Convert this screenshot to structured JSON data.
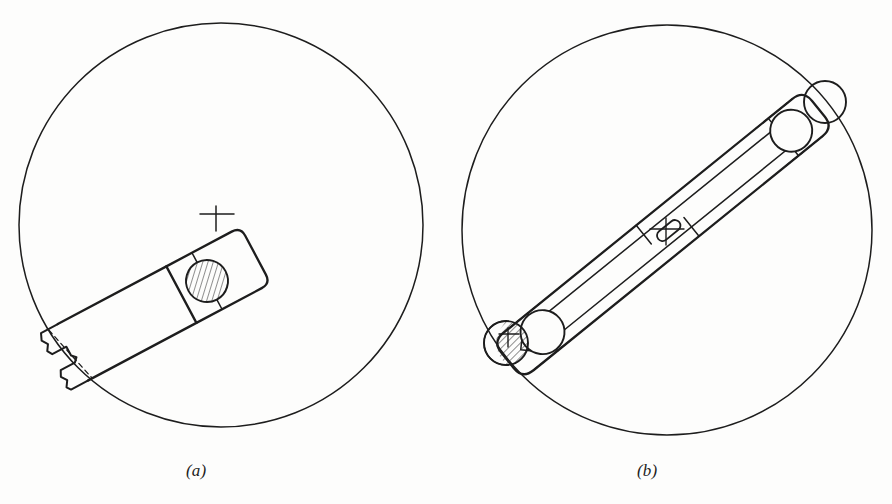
{
  "plate": {
    "title": "Two-view mechanism layout plate",
    "background_color": "#fdfdfc",
    "line_color": "#1d1d1d",
    "hatch_color": "#2a2a2a",
    "width": 892,
    "height": 504
  },
  "figures": [
    {
      "id": "a",
      "caption": "(a)",
      "description": "Single crank arm with one hatched pin boss inside a large circle, bar broken off at far end",
      "circle": {
        "cx": 221,
        "cy": 225,
        "r": 202
      },
      "bar_angle_deg": -28,
      "pad": {
        "name": "pin-pad-upper-right",
        "corner_radius": 10,
        "crosshair": {
          "x": 216,
          "y": 219
        }
      },
      "pin": {
        "name": "hatched-pin-a",
        "cx": 207,
        "cy": 281,
        "r": 21,
        "hatched": true,
        "hatch_fraction": "full"
      },
      "broken_end": {
        "name": "break-line-notch",
        "style": "zigzag-break-with-keyway-notch"
      },
      "hidden_line": {
        "name": "hidden-edge-dashed",
        "style": "dashed"
      }
    },
    {
      "id": "b",
      "caption": "(b)",
      "description": "Connecting link spanning a large circle with two hatched pin bosses at opposite ends and a center slot",
      "circle": {
        "cx": 667,
        "cy": 230,
        "r": 205
      },
      "bar_angle_deg": -36,
      "pads": [
        {
          "name": "pin-pad-upper-right",
          "corner_radius": 11,
          "center": {
            "x": 817,
            "y": 102
          }
        },
        {
          "name": "pin-pad-lower-left",
          "corner_radius": 11,
          "center": {
            "x": 512,
            "y": 348
          }
        }
      ],
      "pins": [
        {
          "name": "hatched-pin-b-upper",
          "cx": 825,
          "cy": 102,
          "r": 21,
          "hatched": true,
          "hatch_fraction": "left-crescent"
        },
        {
          "name": "hatched-pin-b-lower",
          "cx": 506,
          "cy": 343,
          "r": 22,
          "hatched": true,
          "hatch_fraction": "most",
          "crosshair": {
            "x": 508,
            "y": 338
          }
        }
      ],
      "center_slot": {
        "name": "center-obround-slot",
        "cx": 669,
        "cy": 228,
        "length": 26,
        "width": 9,
        "crosshair": {
          "x": 664,
          "y": 231
        }
      }
    }
  ],
  "captions": {
    "a": "(a)",
    "b": "(b)"
  }
}
